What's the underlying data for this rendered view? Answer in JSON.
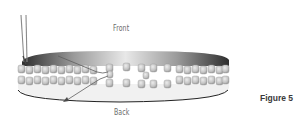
{
  "diagram": {
    "labels": {
      "front": "Front",
      "back": "Back"
    },
    "caption": "Figure 5",
    "colors": {
      "bead_fill": "#c8c8c8",
      "bead_shade": "#9a9a9a",
      "band_dark": "#3c3c3c",
      "band_light": "#e6e6e6",
      "thread": "#6a6a6a",
      "needle": "#8a8a8a",
      "text": "#6b6b6b",
      "caption": "#3a3a3a"
    },
    "icons": [
      "needle-icon",
      "arrow-icon"
    ]
  }
}
